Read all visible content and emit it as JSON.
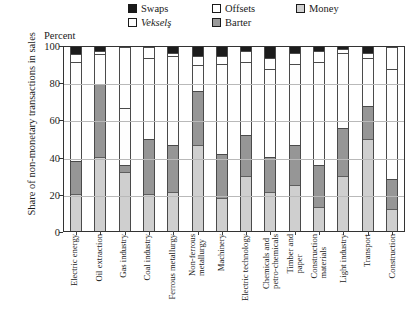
{
  "chart_data": {
    "type": "bar",
    "subtype": "stacked-percentage-column",
    "title": "",
    "xlabel": "",
    "ylabel": "Share of non-monetary transactions in sales",
    "axis_caption": "Percent",
    "ylim": [
      0,
      100
    ],
    "yticks": [
      0,
      20,
      40,
      60,
      80,
      100
    ],
    "grid": true,
    "legend_position": "top",
    "categories": [
      "Electric energy",
      "Oil extraction",
      "Gas industry",
      "Coal industry",
      "Ferrous metallurgy",
      "Non-ferrous metallurgy",
      "Machinery",
      "Electric technology",
      "Chemicals and petro-chemicals",
      "Timber and paper",
      "Construction materials",
      "Light industry",
      "Transport",
      "Construction"
    ],
    "series": [
      {
        "name": "Money",
        "color": "#cfcfcf",
        "values": [
          20,
          40,
          32,
          20,
          21,
          47,
          18,
          30,
          21,
          25,
          13,
          30,
          50,
          12
        ]
      },
      {
        "name": "Barter",
        "color": "#969696",
        "values": [
          18,
          40,
          4,
          30,
          26,
          29,
          24,
          22,
          19,
          22,
          23,
          26,
          18,
          16
        ]
      },
      {
        "name": "Vekselş",
        "color": "#fefefe",
        "values": [
          54,
          16,
          31,
          44,
          48,
          14,
          49,
          40,
          48,
          44,
          56,
          41,
          26,
          60
        ]
      },
      {
        "name": "Offsets",
        "color": "#ffffff",
        "values": [
          4,
          2,
          33,
          6,
          2,
          5,
          4,
          6,
          6,
          6,
          6,
          2,
          3,
          12
        ]
      },
      {
        "name": "Swaps",
        "color": "#1c1c1c",
        "values": [
          4,
          2,
          0,
          0,
          3,
          5,
          5,
          2,
          6,
          3,
          2,
          1,
          3,
          0
        ]
      }
    ]
  },
  "legend": {
    "row1": [
      {
        "label": "Swaps",
        "swatch": "swaps",
        "italic": false
      },
      {
        "label": "Offsets",
        "swatch": "offsets",
        "italic": false
      },
      {
        "label": "Money",
        "swatch": "money",
        "italic": false
      }
    ],
    "row2": [
      {
        "label": "Vekselş",
        "swatch": "veksels",
        "italic": true
      },
      {
        "label": "Barter",
        "swatch": "barter",
        "italic": false
      }
    ]
  },
  "axes": {
    "y_title": "Share of non-monetary transactions in sales",
    "percent_caption": "Percent",
    "y_tick_labels": [
      "100",
      "80",
      "60",
      "40",
      "20",
      "0"
    ]
  }
}
